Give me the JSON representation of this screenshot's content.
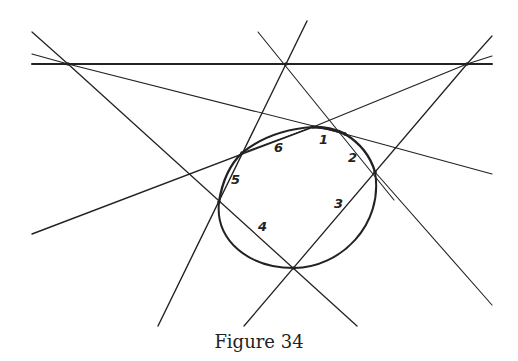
{
  "caption": "Figure 34",
  "colors": {
    "ink": "#222222",
    "background": "#ffffff"
  },
  "points": {
    "A_left": [
      68,
      64
    ],
    "B_mid": [
      286,
      64
    ],
    "C_right": [
      467,
      64
    ],
    "P1": [
      313,
      127
    ],
    "P2": [
      345,
      134
    ],
    "P3": [
      375,
      172
    ],
    "P4": [
      294,
      268
    ],
    "P5": [
      219,
      202
    ],
    "P6": [
      242,
      153
    ]
  },
  "labels": [
    {
      "text": "1",
      "x": 319,
      "y": 144
    },
    {
      "text": "2",
      "x": 348,
      "y": 162
    },
    {
      "text": "3",
      "x": 334,
      "y": 208
    },
    {
      "text": "4",
      "x": 258,
      "y": 231
    },
    {
      "text": "5",
      "x": 231,
      "y": 184
    },
    {
      "text": "6",
      "x": 274,
      "y": 152
    }
  ]
}
